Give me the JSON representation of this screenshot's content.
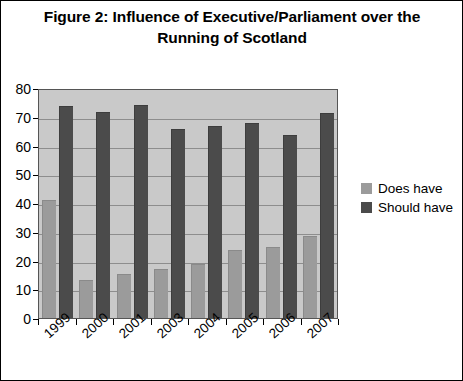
{
  "figure": {
    "title_line1": "Figure 2: Influence of Executive/Parliament over",
    "title_line2": "the Running of Scotland"
  },
  "legend": {
    "position": "right",
    "items": [
      {
        "label": "Does have",
        "color": "#9b9b9b",
        "swatch_name": "legend-swatch-does-have"
      },
      {
        "label": "Should have",
        "color": "#4b4b4b",
        "swatch_name": "legend-swatch-should-have"
      }
    ]
  },
  "axes": {
    "y_ticks": [
      "0",
      "10",
      "20",
      "30",
      "40",
      "50",
      "60",
      "70",
      "80"
    ],
    "x_ticks": [
      "1999",
      "2000",
      "2001",
      "2003",
      "2004",
      "2005",
      "2006",
      "2007"
    ]
  },
  "chart_data": {
    "type": "bar",
    "title": "Figure 2: Influence of Executive/Parliament over the Running of Scotland",
    "xlabel": "",
    "ylabel": "",
    "ylim": [
      0,
      80
    ],
    "ytick_step": 10,
    "grid": true,
    "legend_position": "right",
    "categories": [
      "1999",
      "2000",
      "2001",
      "2003",
      "2004",
      "2005",
      "2006",
      "2007"
    ],
    "series": [
      {
        "name": "Does have",
        "color": "#9b9b9b",
        "values": [
          41,
          13,
          15,
          17,
          18.5,
          23.5,
          24.5,
          28.5
        ]
      },
      {
        "name": "Should have",
        "color": "#4b4b4b",
        "values": [
          74,
          72,
          74.5,
          66,
          67,
          68,
          64,
          71.5
        ]
      }
    ]
  }
}
